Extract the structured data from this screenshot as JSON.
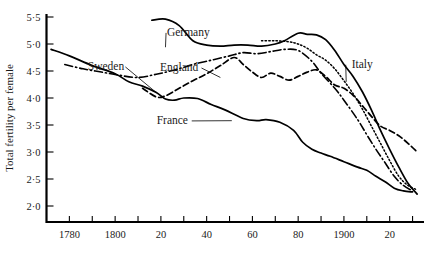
{
  "chart_data": {
    "type": "line",
    "title": "",
    "xlabel": "",
    "ylabel": "Total fertility per female",
    "xlim": [
      1770,
      1935
    ],
    "ylim": [
      1.7,
      5.6
    ],
    "grid": false,
    "legend_position": "inline-annotations",
    "y_ticks": [
      {
        "value": 5.5,
        "label": "5·5"
      },
      {
        "value": 5.0,
        "label": "5·0"
      },
      {
        "value": 4.5,
        "label": "4·5"
      },
      {
        "value": 4.0,
        "label": "4·0"
      },
      {
        "value": 3.5,
        "label": "3·5"
      },
      {
        "value": 3.0,
        "label": "3·0"
      },
      {
        "value": 2.5,
        "label": "2·5"
      },
      {
        "value": 2.0,
        "label": "2·0"
      }
    ],
    "x_ticks": [
      {
        "value": 1780,
        "label": "1780"
      },
      {
        "value": 1790,
        "label": ""
      },
      {
        "value": 1800,
        "label": "1800"
      },
      {
        "value": 1810,
        "label": ""
      },
      {
        "value": 1820,
        "label": "20"
      },
      {
        "value": 1830,
        "label": ""
      },
      {
        "value": 1840,
        "label": "40"
      },
      {
        "value": 1850,
        "label": ""
      },
      {
        "value": 1860,
        "label": "60"
      },
      {
        "value": 1870,
        "label": ""
      },
      {
        "value": 1880,
        "label": "80"
      },
      {
        "value": 1890,
        "label": ""
      },
      {
        "value": 1900,
        "label": "1900"
      },
      {
        "value": 1910,
        "label": ""
      },
      {
        "value": 1920,
        "label": "20"
      },
      {
        "value": 1930,
        "label": ""
      }
    ],
    "series": [
      {
        "name": "France",
        "label": "France",
        "style": "solid",
        "label_x": 1825,
        "label_y": 3.52,
        "leader_to_x": 1851,
        "leader_to_y": 3.58,
        "x": [
          1772,
          1780,
          1790,
          1800,
          1806,
          1812,
          1818,
          1822,
          1826,
          1830,
          1836,
          1842,
          1848,
          1856,
          1862,
          1866,
          1872,
          1878,
          1882,
          1886,
          1890,
          1894,
          1900,
          1906,
          1910,
          1914,
          1918,
          1922,
          1926,
          1930
        ],
        "y": [
          4.9,
          4.78,
          4.6,
          4.45,
          4.3,
          4.22,
          4.1,
          3.98,
          3.96,
          4.0,
          3.99,
          3.88,
          3.78,
          3.62,
          3.58,
          3.6,
          3.55,
          3.4,
          3.18,
          3.05,
          2.98,
          2.92,
          2.82,
          2.72,
          2.66,
          2.55,
          2.45,
          2.33,
          2.28,
          2.26
        ]
      },
      {
        "name": "Sweden",
        "label": "Sweden",
        "style": "dashed",
        "label_x": 1796,
        "label_y": 4.52,
        "leader_to_x": 1818,
        "leader_to_y": 4.1,
        "x": [
          1812,
          1818,
          1822,
          1828,
          1834,
          1840,
          1846,
          1852,
          1856,
          1860,
          1864,
          1868,
          1872,
          1876,
          1880,
          1884,
          1888,
          1892,
          1896,
          1900,
          1904,
          1908,
          1912,
          1916,
          1920,
          1924,
          1928,
          1932
        ],
        "y": [
          4.18,
          4.02,
          4.04,
          4.18,
          4.32,
          4.45,
          4.6,
          4.75,
          4.62,
          4.48,
          4.38,
          4.46,
          4.4,
          4.33,
          4.4,
          4.48,
          4.52,
          4.4,
          4.24,
          4.18,
          4.05,
          3.86,
          3.66,
          3.48,
          3.4,
          3.3,
          3.16,
          3.0
        ]
      },
      {
        "name": "England",
        "label": "England",
        "style": "dashdot",
        "label_x": 1828,
        "label_y": 4.5,
        "leader_to_x": 1846,
        "leader_to_y": 4.38,
        "x": [
          1778,
          1786,
          1794,
          1802,
          1810,
          1818,
          1826,
          1834,
          1842,
          1850,
          1856,
          1862,
          1868,
          1874,
          1880,
          1886,
          1890,
          1896,
          1900,
          1906,
          1910,
          1914,
          1918,
          1922,
          1926,
          1930
        ],
        "y": [
          4.62,
          4.54,
          4.48,
          4.42,
          4.38,
          4.44,
          4.52,
          4.62,
          4.7,
          4.78,
          4.84,
          4.82,
          4.86,
          4.9,
          4.88,
          4.68,
          4.46,
          4.18,
          3.96,
          3.6,
          3.32,
          3.05,
          2.8,
          2.55,
          2.38,
          2.28
        ]
      },
      {
        "name": "Germany",
        "label": "Germany",
        "style": "solid",
        "label_x": 1832,
        "label_y": 5.15,
        "leader_to_x": 1822,
        "leader_to_y": 4.94,
        "x": [
          1816,
          1822,
          1828,
          1834,
          1840,
          1846,
          1852,
          1858,
          1864,
          1870,
          1874,
          1880,
          1884,
          1888,
          1892,
          1896,
          1900,
          1904,
          1908,
          1912,
          1916,
          1920,
          1924,
          1928,
          1932
        ],
        "y": [
          5.44,
          5.46,
          5.34,
          5.06,
          4.98,
          4.96,
          4.98,
          4.98,
          4.96,
          5.0,
          5.06,
          5.2,
          5.18,
          5.17,
          5.08,
          4.88,
          4.62,
          4.4,
          4.12,
          3.78,
          3.4,
          3.05,
          2.72,
          2.42,
          2.22
        ]
      },
      {
        "name": "Italy",
        "label": "Italy",
        "style": "dotted",
        "label_x": 1908,
        "label_y": 4.56,
        "leader_to_x": 1901,
        "leader_to_y": 4.3,
        "x": [
          1864,
          1870,
          1876,
          1880,
          1884,
          1888,
          1892,
          1896,
          1900,
          1904,
          1908,
          1912,
          1916,
          1920,
          1924,
          1928,
          1932
        ],
        "y": [
          5.06,
          5.06,
          5.04,
          5.0,
          4.92,
          4.8,
          4.7,
          4.54,
          4.32,
          4.08,
          3.8,
          3.48,
          3.16,
          2.84,
          2.55,
          2.38,
          2.3
        ]
      }
    ]
  },
  "axis": {
    "y_axis_title": "Total fertility per female"
  }
}
